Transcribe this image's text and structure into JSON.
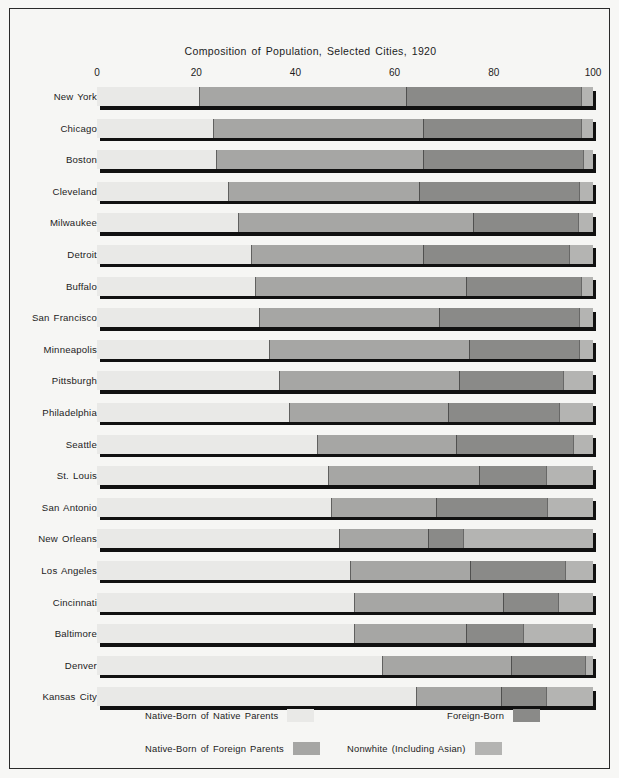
{
  "chart_data": {
    "type": "bar",
    "orientation": "horizontal",
    "stacked": true,
    "title": "Composition of Population, Selected Cities, 1920",
    "xlabel": "",
    "ylabel": "",
    "xlim": [
      0,
      100
    ],
    "xticks": [
      0,
      20,
      40,
      60,
      80,
      100
    ],
    "grid": false,
    "legend_position": "bottom",
    "series": [
      {
        "name": "Native-Born of Native Parents",
        "color": "#e9e9e7",
        "values": [
          20.5,
          23.4,
          24.0,
          26.4,
          28.4,
          31.0,
          31.8,
          32.6,
          34.6,
          36.7,
          38.7,
          44.4,
          46.6,
          47.2,
          48.8,
          51.0,
          51.8,
          51.8,
          57.5,
          64.3
        ]
      },
      {
        "name": "Native-Born of Foreign Parents",
        "color": "#a6a6a4",
        "values": [
          41.8,
          42.3,
          41.7,
          38.6,
          47.4,
          34.7,
          42.6,
          36.4,
          40.4,
          36.3,
          32.1,
          28.0,
          30.4,
          21.1,
          17.9,
          24.2,
          30.0,
          22.6,
          26.0,
          17.2
        ]
      },
      {
        "name": "Foreign-Born",
        "color": "#8a8a88",
        "values": [
          35.3,
          31.9,
          32.3,
          32.2,
          21.1,
          29.5,
          23.1,
          28.2,
          22.1,
          21.0,
          22.3,
          23.6,
          13.5,
          22.4,
          7.1,
          19.2,
          11.1,
          11.5,
          14.9,
          9.0
        ]
      },
      {
        "name": "Nonwhite (Including Asian)",
        "color": "#b4b4b2",
        "values": [
          2.4,
          2.4,
          2.0,
          2.8,
          3.1,
          4.8,
          2.5,
          2.8,
          2.9,
          6.0,
          6.9,
          4.0,
          9.5,
          9.3,
          26.2,
          5.6,
          7.1,
          14.1,
          1.6,
          9.5
        ]
      }
    ],
    "categories": [
      "New York",
      "Chicago",
      "Boston",
      "Cleveland",
      "Milwaukee",
      "Detroit",
      "Buffalo",
      "San Francisco",
      "Minneapolis",
      "Pittsburgh",
      "Philadelphia",
      "Seattle",
      "St. Louis",
      "San Antonio",
      "New Orleans",
      "Los Angeles",
      "Cincinnati",
      "Baltimore",
      "Denver",
      "Kansas City"
    ],
    "legend": [
      {
        "label": "Native-Born of Native Parents",
        "color": "#e9e9e7"
      },
      {
        "label": "Native-Born of Foreign Parents",
        "color": "#a6a6a4"
      },
      {
        "label": "Foreign-Born",
        "color": "#8a8a88"
      },
      {
        "label": "Nonwhite (Including Asian)",
        "color": "#b4b4b2"
      }
    ]
  }
}
